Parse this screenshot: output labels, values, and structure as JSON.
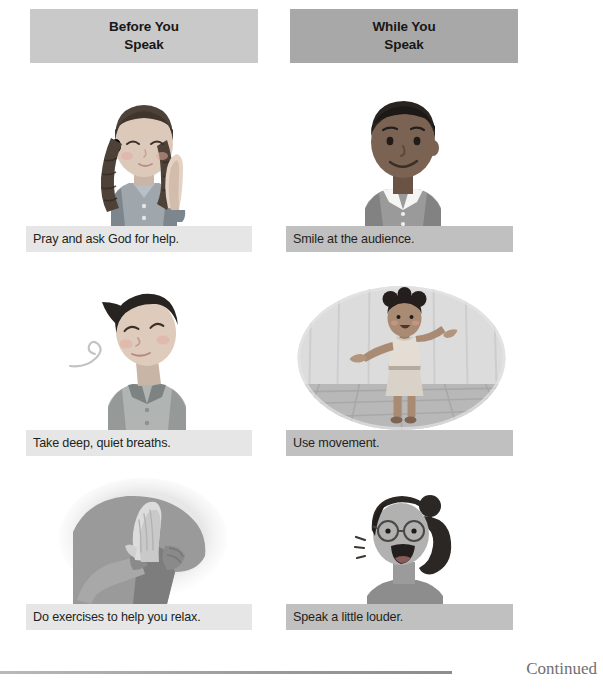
{
  "page": {
    "footer_note": "Continued"
  },
  "columns": [
    {
      "id": "before-you-speak",
      "header": "Before You\nSpeak",
      "header_color": "#c9c9c9",
      "caption_color": "#e6e6e6"
    },
    {
      "id": "while-you-speak",
      "header": "While You\nSpeak",
      "header_color": "#a8a8a8",
      "caption_color": "#c0c0c0"
    }
  ],
  "cells": [
    {
      "column": "before-you-speak",
      "row": 1,
      "caption": "Pray and ask God for help.",
      "illustration": "girl-praying-braids"
    },
    {
      "column": "while-you-speak",
      "row": 1,
      "caption": "Smile at the audience.",
      "illustration": "boy-smiling-collared-shirt"
    },
    {
      "column": "before-you-speak",
      "row": 2,
      "caption": "Take deep, quiet breaths.",
      "illustration": "boy-breathing-eyes-closed"
    },
    {
      "column": "while-you-speak",
      "row": 2,
      "caption": "Use movement.",
      "illustration": "girl-on-stage-arms-out"
    },
    {
      "column": "before-you-speak",
      "row": 3,
      "caption": "Do exercises to help you relax.",
      "illustration": "hands-pressed-stretch"
    },
    {
      "column": "while-you-speak",
      "row": 3,
      "caption": "Speak a little louder.",
      "illustration": "girl-glasses-speaking-loudly"
    }
  ]
}
